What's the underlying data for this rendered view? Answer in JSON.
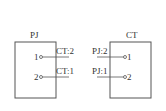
{
  "left_box": {
    "title": "PJ",
    "pins": [
      {
        "number": "1",
        "label": "CT:2"
      },
      {
        "number": "2",
        "label": "CT:1"
      }
    ]
  },
  "right_box": {
    "title": "CT",
    "pins": [
      {
        "number": "1",
        "label": "PJ:2"
      },
      {
        "number": "2",
        "label": "PJ:1"
      }
    ]
  },
  "colors": {
    "stroke": "#555555",
    "text": "#333333"
  }
}
